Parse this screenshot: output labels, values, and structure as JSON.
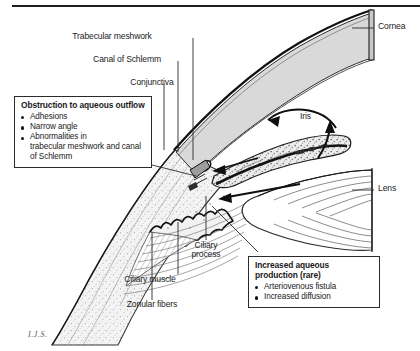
{
  "figure": {
    "artist_signature": "I.J.S.",
    "top_rule_color": "#1d1d1d",
    "ink_color": "#1a1a1a",
    "cornea_fill": "#d8d8d8",
    "sclera_fill": "#efefef",
    "iris_fill": "#e2e2e2",
    "lens_fill": "#ffffff"
  },
  "labels": [
    {
      "name": "trabecular-meshwork",
      "text": "Trabecular meshwork",
      "x": 112,
      "y": 32
    },
    {
      "name": "canal-of-schlemm",
      "text": "Canal of Schlemm",
      "x": 127,
      "y": 55
    },
    {
      "name": "conjunctiva",
      "text": "Conjunctiva",
      "x": 152,
      "y": 78
    },
    {
      "name": "cornea",
      "text": "Cornea",
      "x": 382,
      "y": 28
    },
    {
      "name": "iris",
      "text": "Iris",
      "x": 300,
      "y": 118
    },
    {
      "name": "lens",
      "text": "Lens",
      "x": 382,
      "y": 190
    },
    {
      "name": "ciliary-process",
      "text": "Ciliary process",
      "x": 180,
      "y": 246
    },
    {
      "name": "ciliary-muscle",
      "text": "Ciliary muscle",
      "x": 173,
      "y": 281
    },
    {
      "name": "zonular-fibers",
      "text": "Zonular fibers",
      "x": 148,
      "y": 306
    }
  ],
  "callouts": {
    "obstruction": {
      "title": "Obstruction to aqueous outflow",
      "items": [
        {
          "text": "Adhesions"
        },
        {
          "text": "Narrow angle"
        },
        {
          "text": "Abnormalities in",
          "cont": "trabecular meshwork and canal of Schlemm"
        }
      ]
    },
    "increased_production": {
      "title": "Increased aqueous production (rare)",
      "items": [
        {
          "text": "Arteriovenous fistula"
        },
        {
          "text": "Increased diffusion"
        }
      ]
    }
  },
  "flow_arrows": [
    {
      "name": "aqueous-flow-anterior-chamber",
      "description": "curved arrow in anterior chamber pointing toward the angle"
    },
    {
      "name": "aqueous-flow-over-iris",
      "description": "arrow rising over the pupil margin"
    },
    {
      "name": "aqueous-flow-posterior-chamber",
      "description": "arrow from behind the iris toward the lens"
    },
    {
      "name": "aqueous-flow-into-angle",
      "description": "straight arrow entering the trabecular angle"
    }
  ]
}
